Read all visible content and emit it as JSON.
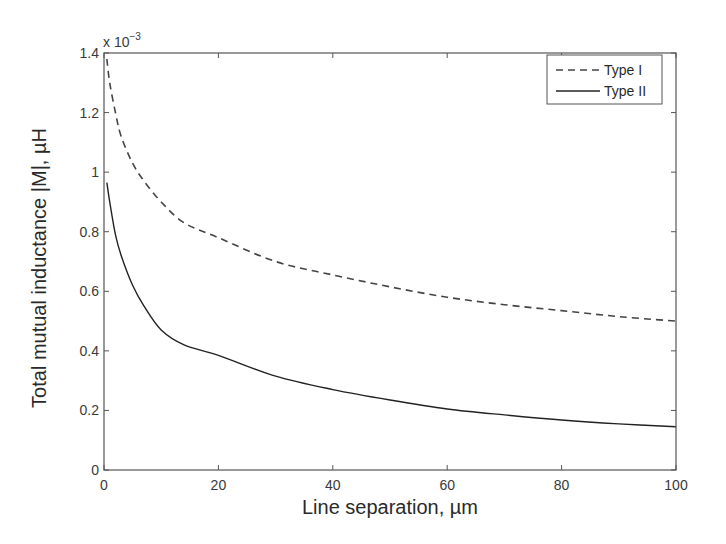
{
  "chart_data": {
    "type": "line",
    "title": "",
    "xlabel": "Line separation, µm",
    "ylabel": "Total mutual inductance |M|, µH",
    "y_multiplier_label": "x 10",
    "y_multiplier_exponent": "−3",
    "xlim": [
      0,
      100
    ],
    "ylim": [
      0,
      1.4
    ],
    "xticks": [
      0,
      20,
      40,
      60,
      80,
      100
    ],
    "xtick_labels": [
      "0",
      "20",
      "40",
      "60",
      "80",
      "100"
    ],
    "yticks": [
      0,
      0.2,
      0.4,
      0.6,
      0.8,
      1.0,
      1.2,
      1.4
    ],
    "ytick_labels": [
      "0",
      "0.2",
      "0.4",
      "0.6",
      "0.8",
      "1",
      "1.2",
      "1.4"
    ],
    "grid": false,
    "legend_position": "upper right",
    "series": [
      {
        "name": "Type I",
        "style": "dashed",
        "color": "#444444",
        "x": [
          0.5,
          1,
          2,
          3,
          5,
          7,
          10,
          14,
          20,
          30,
          40,
          50,
          60,
          70,
          80,
          90,
          100
        ],
        "y": [
          1.38,
          1.3,
          1.2,
          1.12,
          1.03,
          0.97,
          0.9,
          0.83,
          0.78,
          0.7,
          0.655,
          0.615,
          0.58,
          0.555,
          0.535,
          0.515,
          0.5
        ]
      },
      {
        "name": "Type II",
        "style": "solid",
        "color": "#222222",
        "x": [
          0.5,
          1,
          2,
          3,
          5,
          7,
          10,
          14,
          20,
          30,
          40,
          50,
          60,
          70,
          80,
          90,
          100
        ],
        "y": [
          0.965,
          0.9,
          0.79,
          0.72,
          0.62,
          0.55,
          0.47,
          0.42,
          0.385,
          0.315,
          0.27,
          0.235,
          0.205,
          0.185,
          0.168,
          0.155,
          0.145
        ]
      }
    ]
  }
}
